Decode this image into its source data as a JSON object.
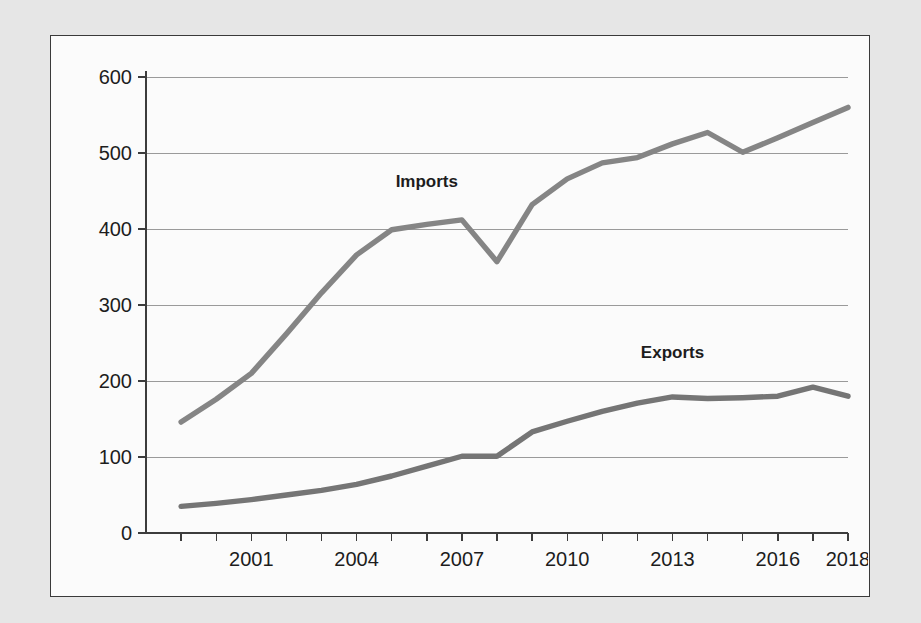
{
  "chart_data": {
    "type": "line",
    "title": "",
    "xlabel": "",
    "ylabel": "",
    "xlim": [
      1999,
      2018
    ],
    "ylim": [
      0,
      600
    ],
    "ytick_values": [
      0,
      100,
      200,
      300,
      400,
      500,
      600
    ],
    "ytick_labels": [
      "0",
      "100",
      "200",
      "300",
      "400",
      "500",
      "600"
    ],
    "xtick_values": [
      2001,
      2004,
      2007,
      2010,
      2013,
      2016,
      2018
    ],
    "xtick_labels": [
      "2001",
      "2004",
      "2007",
      "2010",
      "2013",
      "2016",
      "2018"
    ],
    "grid": "horizontal",
    "legend_position": "inline-annotation",
    "x": [
      1999,
      2000,
      2001,
      2002,
      2003,
      2004,
      2005,
      2006,
      2007,
      2008,
      2009,
      2010,
      2011,
      2012,
      2013,
      2014,
      2015,
      2016,
      2017,
      2018
    ],
    "series": [
      {
        "name": "Imports",
        "color": "#858585",
        "label_x": 2006,
        "label_y": 455,
        "values": [
          146,
          176,
          210,
          262,
          316,
          366,
          399,
          406,
          412,
          357,
          432,
          466,
          487,
          494,
          512,
          527,
          501,
          520,
          540,
          560
        ]
      },
      {
        "name": "Exports",
        "color": "#757575",
        "label_x": 2013,
        "label_y": 230,
        "values": [
          35,
          39,
          44,
          50,
          56,
          64,
          75,
          88,
          101,
          101,
          133,
          147,
          160,
          171,
          179,
          177,
          178,
          180,
          192,
          180
        ]
      }
    ]
  }
}
